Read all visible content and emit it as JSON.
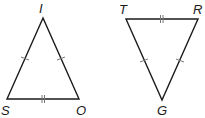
{
  "diagram": {
    "type": "geometry-congruent-triangles",
    "stroke_color": "#1a1a1a",
    "tick_color": "#777777",
    "triangles": [
      {
        "name": "triangle-ISO",
        "vertices": {
          "I": {
            "label": "I",
            "x": 43,
            "y": 18
          },
          "S": {
            "label": "S",
            "x": 7,
            "y": 99
          },
          "O": {
            "label": "O",
            "x": 79,
            "y": 99
          }
        },
        "marks": [
          {
            "side": "IS",
            "ticks": 1
          },
          {
            "side": "IO",
            "ticks": 1
          },
          {
            "side": "SO",
            "ticks": 2
          }
        ]
      },
      {
        "name": "triangle-TRG",
        "vertices": {
          "T": {
            "label": "T",
            "x": 126,
            "y": 19
          },
          "R": {
            "label": "R",
            "x": 198,
            "y": 19
          },
          "G": {
            "label": "G",
            "x": 162,
            "y": 100
          }
        },
        "marks": [
          {
            "side": "TG",
            "ticks": 1
          },
          {
            "side": "RG",
            "ticks": 1
          },
          {
            "side": "TR",
            "ticks": 2
          }
        ]
      }
    ]
  },
  "labels": {
    "I": "I",
    "S": "S",
    "O": "O",
    "T": "T",
    "R": "R",
    "G": "G"
  }
}
